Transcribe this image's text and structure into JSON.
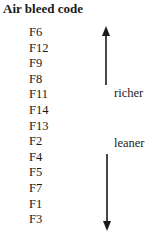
{
  "title": "Air bleed code",
  "codes": [
    "F6",
    "F12",
    "F9",
    "F8",
    "F11",
    "F14",
    "F13",
    "F2",
    "F4",
    "F5",
    "F7",
    "F1",
    "F3"
  ],
  "labels": {
    "richer": "richer",
    "leaner": "leaner"
  },
  "arrows": {
    "up": "arrow-up-icon",
    "down": "arrow-down-icon"
  }
}
